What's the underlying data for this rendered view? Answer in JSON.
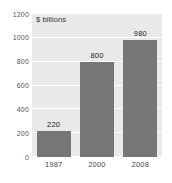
{
  "chart_data": {
    "type": "bar",
    "title": "",
    "unit_label": "$ billions",
    "xlabel": "",
    "ylabel": "",
    "categories": [
      "1987",
      "2000",
      "2008"
    ],
    "values": [
      220,
      800,
      980
    ],
    "data_labels": [
      "220",
      "800",
      "980"
    ],
    "ylim": [
      0,
      1200
    ],
    "yticks": [
      0,
      200,
      400,
      600,
      800,
      1000,
      1200
    ],
    "ytick_labels": [
      "0",
      "200",
      "400",
      "600",
      "800",
      "1000",
      "1200"
    ],
    "grid": true,
    "legend": "none",
    "colors": {
      "bar": "#767676",
      "plot_background": "#e9e9e9",
      "gridline": "#ffffff",
      "page_background": "#ffffff",
      "tick_text": "#555555",
      "label_text": "#222222"
    }
  }
}
